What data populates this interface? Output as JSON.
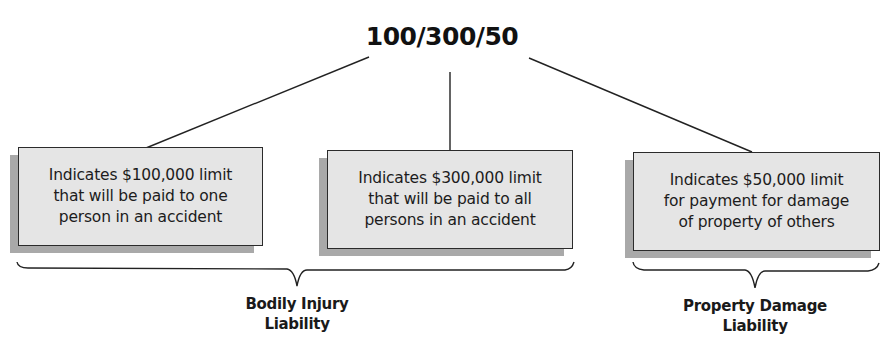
{
  "diagram": {
    "title": "100/300/50",
    "boxes": [
      {
        "id": "bodily-injury-per-person",
        "lines": [
          "Indicates $100,000 limit",
          "that will be paid to one",
          "person in an accident"
        ]
      },
      {
        "id": "bodily-injury-per-accident",
        "lines": [
          "Indicates $300,000 limit",
          "that will be paid to all",
          "persons in an accident"
        ]
      },
      {
        "id": "property-damage",
        "lines": [
          "Indicates $50,000 limit",
          "for payment for damage",
          "of property of others"
        ]
      }
    ],
    "groups": [
      {
        "id": "bodily-injury-liability",
        "lines": [
          "Bodily Injury",
          "Liability"
        ],
        "covers_boxes": [
          0,
          1
        ]
      },
      {
        "id": "property-damage-liability",
        "lines": [
          "Property Damage",
          "Liability"
        ],
        "covers_boxes": [
          2
        ]
      }
    ],
    "colors": {
      "box_fill": "#e5e5e5",
      "box_border": "#2b2b2b",
      "shadow": "#a9a9a9",
      "line": "#222222",
      "text": "#1a1a1a"
    }
  }
}
